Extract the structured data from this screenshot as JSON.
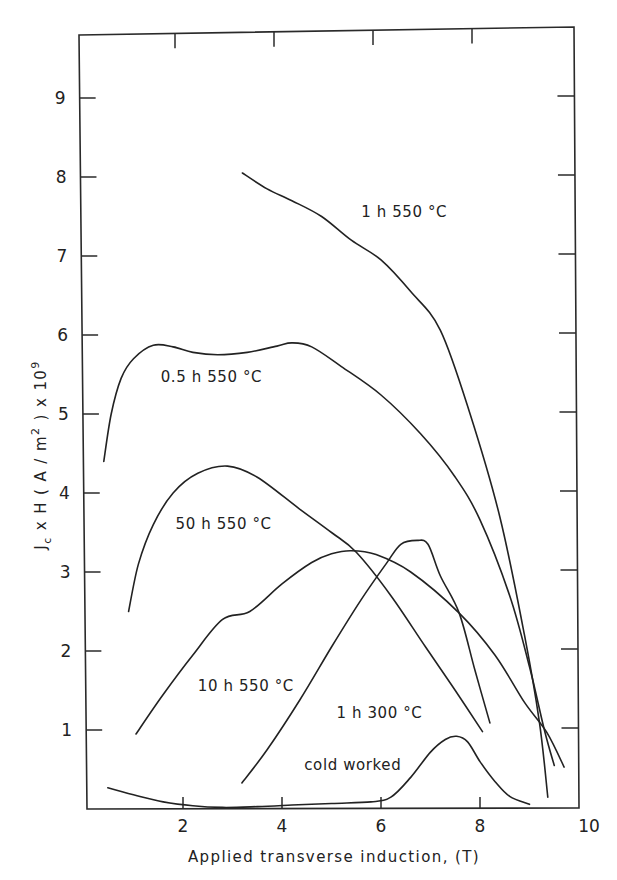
{
  "chart_data": {
    "type": "line",
    "title": "",
    "xlabel": "Applied transverse induction, (T)",
    "ylabel": "J_c x H (A/m^2) x 10^9",
    "ylabel_parts": {
      "j": "J",
      "sub_c": "c",
      "mid": " x H  ( A / m",
      "sup2": "2",
      "end": " ) x 10",
      "sup9": "9"
    },
    "xlim": [
      0,
      10
    ],
    "ylim": [
      0,
      9.8
    ],
    "x_ticks": [
      2,
      4,
      6,
      8,
      10
    ],
    "x_tick_labels": [
      "2",
      "4",
      "6",
      "8",
      "10"
    ],
    "y_ticks": [
      1,
      2,
      3,
      4,
      5,
      6,
      7,
      8,
      9
    ],
    "y_tick_labels": [
      "1",
      "2",
      "3",
      "4",
      "5",
      "6",
      "7",
      "8",
      "9"
    ],
    "grid": false,
    "legend": "inline curve labels",
    "series": [
      {
        "name": "1 h 550 °C",
        "label_pos": [
          5.6,
          7.5
        ],
        "x": [
          3.2,
          3.7,
          4.2,
          4.8,
          5.4,
          6.0,
          6.6,
          7.2,
          7.8,
          8.4,
          8.9,
          9.2,
          9.37
        ],
        "y": [
          8.05,
          7.85,
          7.7,
          7.5,
          7.2,
          6.95,
          6.55,
          6.06,
          5.0,
          3.7,
          2.2,
          1.1,
          0.15
        ]
      },
      {
        "name": "0.5 h 550 °C",
        "label_pos": [
          1.55,
          5.4
        ],
        "x": [
          0.4,
          0.55,
          0.75,
          1.0,
          1.4,
          1.8,
          2.2,
          2.7,
          3.3,
          3.9,
          4.2,
          4.6,
          5.2,
          6.0,
          6.8,
          7.5,
          8.0,
          8.6,
          9.0,
          9.3,
          9.5
        ],
        "y": [
          4.4,
          5.0,
          5.45,
          5.7,
          5.87,
          5.85,
          5.78,
          5.75,
          5.78,
          5.86,
          5.9,
          5.85,
          5.6,
          5.24,
          4.75,
          4.2,
          3.66,
          2.7,
          1.8,
          1.0,
          0.55
        ]
      },
      {
        "name": "50 h 550 °C",
        "label_pos": [
          1.85,
          3.55
        ],
        "x": [
          0.9,
          1.1,
          1.4,
          1.8,
          2.3,
          2.9,
          3.5,
          4.35,
          5.0,
          5.5,
          6.2,
          6.9,
          7.5,
          8.05
        ],
        "y": [
          2.5,
          3.1,
          3.6,
          4.0,
          4.25,
          4.34,
          4.2,
          3.8,
          3.5,
          3.25,
          2.7,
          2.05,
          1.5,
          0.98
        ]
      },
      {
        "name": "10 h 550 °C",
        "label_pos": [
          2.3,
          1.5
        ],
        "x": [
          1.05,
          1.6,
          2.2,
          2.8,
          3.35,
          4.0,
          4.6,
          5.0,
          5.4,
          5.9,
          6.6,
          7.58,
          8.3,
          8.9,
          9.35,
          9.7
        ],
        "y": [
          0.95,
          1.45,
          1.95,
          2.4,
          2.5,
          2.85,
          3.12,
          3.23,
          3.27,
          3.22,
          3.0,
          2.48,
          1.95,
          1.35,
          0.97,
          0.53
        ]
      },
      {
        "name": "1 h 300 °C",
        "label_pos": [
          5.1,
          1.15
        ],
        "x": [
          3.19,
          3.7,
          4.36,
          5.0,
          5.6,
          6.1,
          6.4,
          6.73,
          6.95,
          7.2,
          7.58,
          7.9,
          8.2
        ],
        "y": [
          0.33,
          0.75,
          1.38,
          2.05,
          2.65,
          3.1,
          3.35,
          3.4,
          3.35,
          2.95,
          2.48,
          1.75,
          1.09
        ]
      },
      {
        "name": "cold worked",
        "label_pos": [
          4.45,
          0.5
        ],
        "x": [
          0.48,
          1.0,
          1.6,
          2.2,
          2.8,
          3.5,
          4.2,
          5.0,
          5.8,
          6.2,
          6.6,
          7.0,
          7.3,
          7.53,
          7.75,
          8.0,
          8.3,
          8.6,
          9.0
        ],
        "y": [
          0.27,
          0.18,
          0.09,
          0.04,
          0.02,
          0.03,
          0.05,
          0.07,
          0.09,
          0.15,
          0.4,
          0.72,
          0.88,
          0.92,
          0.85,
          0.6,
          0.35,
          0.16,
          0.06
        ]
      }
    ]
  }
}
